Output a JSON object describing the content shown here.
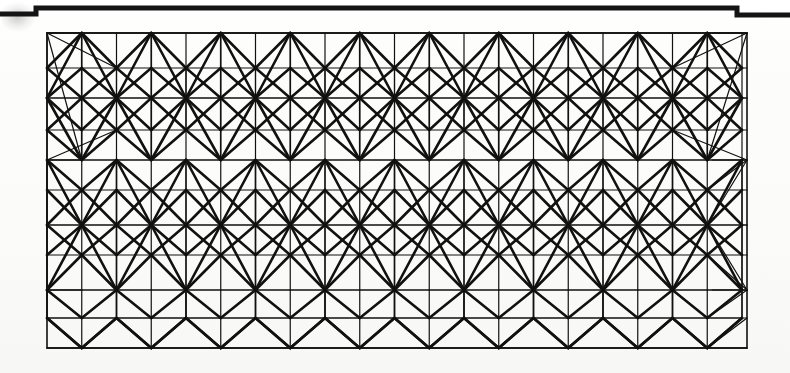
{
  "document": {
    "kind": "scanned-technical-drawing",
    "title": "Space frame truss elevation",
    "page_background": "#fdfdfc",
    "ink_color": "#111111",
    "paper_edge_color": "#1a1a1a"
  },
  "canvas": {
    "width": 790,
    "height": 373
  },
  "paper_edge": {
    "name": "scanned page top edge",
    "description": "Dark stepped horizontal band across the top of the scan with a notch at each side",
    "stroke": "#141414",
    "thickness": 5,
    "left_step_x": 36,
    "left_step_y": 14,
    "main_y": 8,
    "right_step_x": 737,
    "right_step_y": 15,
    "end_x": 790
  },
  "smudge": {
    "name": "scan corner smudge",
    "x": 2,
    "y": 2,
    "width": 34,
    "height": 30
  },
  "frame": {
    "name": "outer rectangular border of the truss",
    "x": 47,
    "y": 33,
    "width": 700,
    "height": 315,
    "stroke": "#111111",
    "stroke_width": 1.6
  },
  "truss": {
    "type": "space-frame-elevation",
    "description": "Repeating triangulated space frame: three deep bands of alternating hub nodes joined by diagonals, chords and verticals",
    "bay_width": 69.5,
    "bay_count": 10,
    "left_x": 47,
    "right_x": 747,
    "chord_rows_y": [
      33,
      68,
      98,
      130,
      160,
      190,
      225,
      255,
      290,
      318,
      348
    ],
    "hub_rows_y": [
      98,
      190,
      290
    ],
    "edge_node_rows_y": [
      33,
      160,
      290
    ],
    "thin_stroke": 1.2,
    "medium_stroke": 1.7,
    "thick_stroke": 2.6,
    "stroke_color": "#111111"
  },
  "chart_data": {
    "type": "diagram",
    "nodes_per_bay": 4,
    "bands": 3,
    "bay_count": 10
  }
}
